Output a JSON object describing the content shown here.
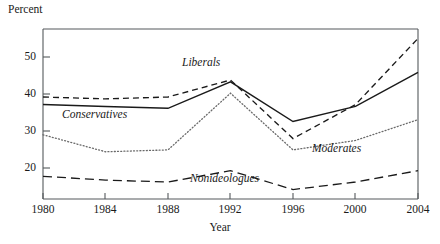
{
  "chart_data": {
    "type": "line",
    "title": "",
    "xlabel": "Year",
    "ylabel": "Percent",
    "x": [
      1980,
      1984,
      1988,
      1992,
      1996,
      2000,
      2004
    ],
    "xlim": [
      1980,
      2004
    ],
    "ylim": [
      13,
      58
    ],
    "xticks": [
      1980,
      1984,
      1988,
      1992,
      1996,
      2000,
      2004
    ],
    "xtick_labels": [
      "1980",
      "1984",
      "1988",
      "1992",
      "1996",
      "2000",
      "2004"
    ],
    "yticks": [
      20,
      30,
      40,
      50
    ],
    "ytick_labels": [
      "20",
      "30",
      "40",
      "50"
    ],
    "grid": false,
    "legend": "inline-annotations",
    "series": [
      {
        "name": "Liberals",
        "style": "dashed",
        "color": "#1a1a1a",
        "values": [
          40,
          39.5,
          40,
          44.5,
          29,
          38,
          55.5
        ],
        "label_x": 1992,
        "label_text": "Liberals"
      },
      {
        "name": "Conservatives",
        "style": "solid",
        "color": "#1a1a1a",
        "values": [
          38,
          37.5,
          37,
          44,
          33.5,
          37.5,
          46.5
        ],
        "label_x": 1985,
        "label_text": "Conservatives"
      },
      {
        "name": "Moderates",
        "style": "dotted",
        "color": "#6a6a6a",
        "values": [
          30,
          25.5,
          26,
          41,
          26,
          28.5,
          34
        ],
        "label_x": 1998,
        "label_text": "Moderates"
      },
      {
        "name": "Nonideologues",
        "style": "longdash",
        "color": "#1a1a1a",
        "values": [
          19,
          18,
          17.5,
          20.5,
          15.5,
          17.5,
          20.5
        ],
        "label_x": 1993,
        "label_text": "Nonideologues"
      }
    ]
  },
  "axes": {
    "ylabel": "Percent",
    "xlabel": "Year",
    "ytick_labels": [
      "50",
      "40",
      "30",
      "20"
    ],
    "xtick_labels": [
      "1980",
      "1984",
      "1988",
      "1992",
      "1996",
      "2000",
      "2004"
    ]
  },
  "annotations": {
    "liberals": "Liberals",
    "conservatives": "Conservatives",
    "moderates": "Moderates",
    "nonideologues": "Nonideologues"
  }
}
